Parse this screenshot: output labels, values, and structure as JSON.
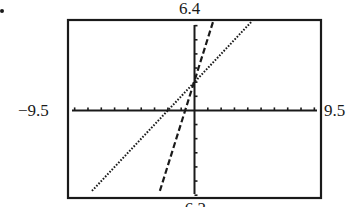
{
  "marker": "•",
  "window": {
    "ymax_label": "6.4",
    "ymin_label": "-6.2",
    "xmin_label": "−9.5",
    "xmax_label": "9.5"
  },
  "chart_data": {
    "type": "line",
    "title": "",
    "xlabel": "",
    "ylabel": "",
    "xlim": [
      -9.5,
      9.5
    ],
    "ylim": [
      -6.2,
      6.4
    ],
    "xscl": 1,
    "yscl": 1,
    "grid": false,
    "legend": null,
    "axis_window_labels": {
      "top": "6.4",
      "bottom": "-6.2",
      "left": "-9.5",
      "right": "9.5"
    },
    "series": [
      {
        "name": "y = x + 2",
        "style": "dotted",
        "color": "#1a1a1a",
        "slope": 1,
        "intercept": 2,
        "x": [
          -7.7,
          4.3
        ],
        "y": [
          -5.7,
          6.3
        ]
      },
      {
        "name": "y = 3x + 2",
        "style": "dashed",
        "color": "#1a1a1a",
        "slope": 3,
        "intercept": 2,
        "x": [
          -2.6,
          1.4
        ],
        "y": [
          -5.7,
          6.3
        ]
      }
    ],
    "intersection": {
      "x": 0,
      "y": 2
    }
  }
}
